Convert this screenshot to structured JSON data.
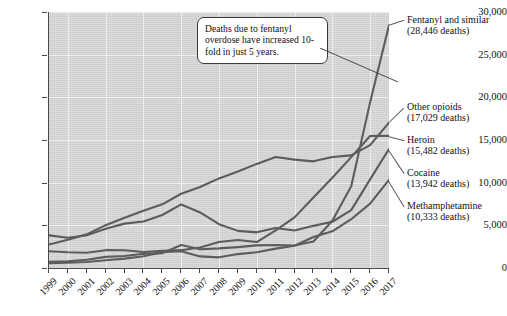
{
  "chart_data": {
    "type": "line",
    "title": "",
    "xlabel": "",
    "ylabel": "",
    "grid": true,
    "legend_position": "right-inline-labels",
    "ylim": [
      0,
      30000
    ],
    "y_ticks": [
      0,
      5000,
      10000,
      15000,
      20000,
      25000,
      30000
    ],
    "y_tick_labels": [
      "0",
      "5,000",
      "10,000",
      "15,000",
      "20,000",
      "25,000",
      "30,000"
    ],
    "x": [
      1999,
      2000,
      2001,
      2002,
      2003,
      2004,
      2005,
      2006,
      2007,
      2008,
      2009,
      2010,
      2011,
      2012,
      2013,
      2014,
      2015,
      2016,
      2017
    ],
    "x_tick_labels": [
      "1999",
      "2000",
      "2001",
      "2002",
      "2003",
      "2004",
      "2005",
      "2006",
      "2007",
      "2008",
      "2009",
      "2010",
      "2011",
      "2012",
      "2013",
      "2014",
      "2015",
      "2016",
      "2017"
    ],
    "series": [
      {
        "name": "Fentanyl and similar",
        "end_value": 28446,
        "values": [
          730,
          780,
          960,
          1300,
          1400,
          1660,
          1740,
          2700,
          2200,
          2300,
          2450,
          2650,
          2700,
          2630,
          3100,
          5540,
          9580,
          19410,
          28446
        ]
      },
      {
        "name": "Other opioids",
        "end_value": 17029,
        "values": [
          2750,
          3300,
          3940,
          5020,
          5900,
          6700,
          7460,
          8700,
          9500,
          10500,
          11300,
          12200,
          13000,
          12700,
          12500,
          13000,
          13200,
          14400,
          17029
        ]
      },
      {
        "name": "Heroin",
        "end_value": 15482,
        "values": [
          1960,
          1840,
          1780,
          2090,
          2080,
          1880,
          2010,
          2090,
          2400,
          3040,
          3280,
          3040,
          4400,
          5930,
          8260,
          10570,
          12990,
          15470,
          15482
        ]
      },
      {
        "name": "Cocaine",
        "end_value": 13942,
        "values": [
          3820,
          3540,
          3830,
          4600,
          5200,
          5440,
          6210,
          7450,
          6510,
          5130,
          4350,
          4180,
          4680,
          4400,
          4940,
          5420,
          6780,
          10380,
          13942
        ]
      },
      {
        "name": "Methamphetamine",
        "end_value": 10333,
        "values": [
          550,
          620,
          700,
          900,
          1100,
          1370,
          1860,
          1970,
          1360,
          1250,
          1630,
          1850,
          2270,
          2600,
          3630,
          4300,
          5720,
          7540,
          10333
        ]
      }
    ],
    "annotation": {
      "text": "Deaths due to fentanyl overdose have increased 10-fold in just 5 years."
    },
    "series_labels": [
      {
        "title": "Fentanyl and similar",
        "count": "(28,446 deaths)"
      },
      {
        "title": "Other opioids",
        "count": "(17,029 deaths)"
      },
      {
        "title": "Heroin",
        "count": "(15,482 deaths)"
      },
      {
        "title": "Cocaine",
        "count": "(13,942 deaths)"
      },
      {
        "title": "Methamphetamine",
        "count": "(10,333 deaths)"
      }
    ],
    "colors": {
      "plot_background": "#d9d9d9",
      "gridline": "#f4f4f4",
      "line": "#5c5c5c",
      "axis": "#4a4a4a",
      "text": "#111111",
      "callout_background": "#ffffff"
    }
  }
}
